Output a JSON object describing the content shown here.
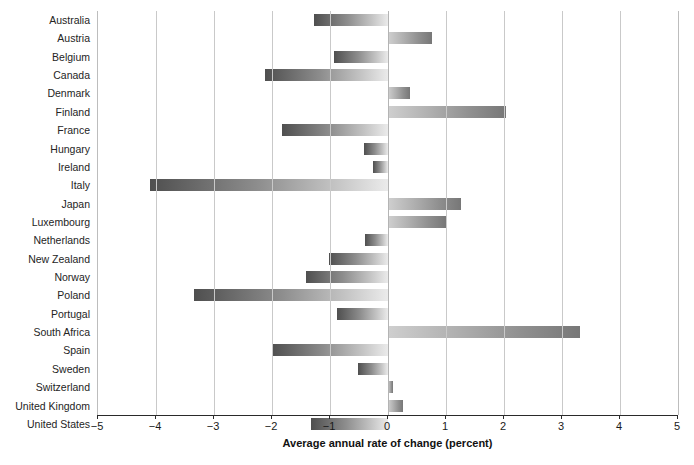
{
  "chart_data": {
    "type": "bar",
    "orientation": "horizontal",
    "title": "",
    "xlabel": "Average annual rate of change (percent)",
    "ylabel": "",
    "xlim": [
      -5,
      5
    ],
    "xticks": [
      -5,
      -4,
      -3,
      -2,
      -1,
      0,
      1,
      2,
      3,
      4,
      5
    ],
    "xticklabels": [
      "−5",
      "−4",
      "−3",
      "−2",
      "−1",
      "0",
      "1",
      "2",
      "3",
      "4",
      "5"
    ],
    "grid": "vertical",
    "legend": "none",
    "categories": [
      "Australia",
      "Austria",
      "Belgium",
      "Canada",
      "Denmark",
      "Finland",
      "France",
      "Hungary",
      "Ireland",
      "Italy",
      "Japan",
      "Luxembourg",
      "Netherlands",
      "New Zealand",
      "Norway",
      "Poland",
      "Portugal",
      "South Africa",
      "Spain",
      "Sweden",
      "Switzerland",
      "United Kingdom",
      "United States"
    ],
    "values": [
      -1.28,
      0.76,
      -0.93,
      -2.12,
      0.38,
      2.03,
      -1.83,
      -0.41,
      -0.26,
      -4.1,
      1.26,
      1.0,
      -0.39,
      -1.02,
      -1.41,
      -3.34,
      -0.88,
      3.31,
      -2.0,
      -0.52,
      0.08,
      0.26,
      -1.33
    ],
    "colors": {
      "bar_gradient_start": "#4f4f4f",
      "bar_gradient_end": "#ebebeb",
      "gridline": "#c9c9c9",
      "axis": "#2a2a2a",
      "text": "#1a1a1a",
      "background": "#ffffff"
    }
  }
}
